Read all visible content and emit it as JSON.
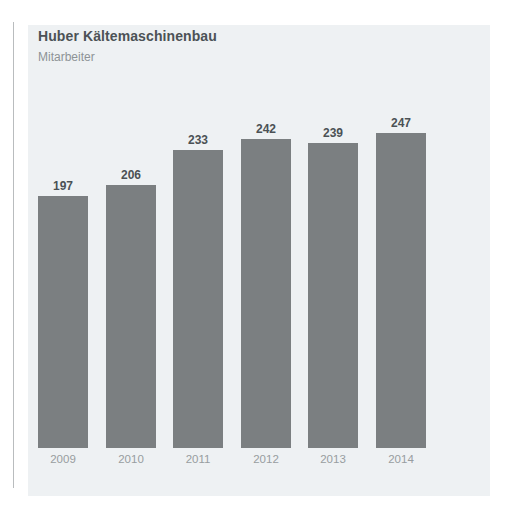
{
  "chart_data": {
    "type": "bar",
    "title": "Huber Kältemaschinenbau",
    "subtitle": "Mitarbeiter",
    "xlabel": "",
    "ylabel": "Mitarbeiter",
    "categories": [
      "2009",
      "2010",
      "2011",
      "2012",
      "2013",
      "2014"
    ],
    "values": [
      197,
      206,
      233,
      242,
      239,
      247
    ],
    "value_labels": [
      "197",
      "206",
      "233",
      "242",
      "239",
      "247"
    ],
    "ylim": [
      0,
      260
    ],
    "grid": false,
    "legend": null,
    "series": [
      {
        "name": "Mitarbeiter",
        "values": [
          197,
          206,
          233,
          242,
          239,
          247
        ]
      }
    ],
    "colors": {
      "bar": "#7b7f81",
      "panel_background": "#eef1f3",
      "page_background": "#ffffff",
      "title_text": "#4c5256",
      "subtitle_text": "#8d9396",
      "value_label_text": "#4b5155",
      "category_label_text": "#989da0",
      "rule": "#b9bcbe"
    }
  }
}
